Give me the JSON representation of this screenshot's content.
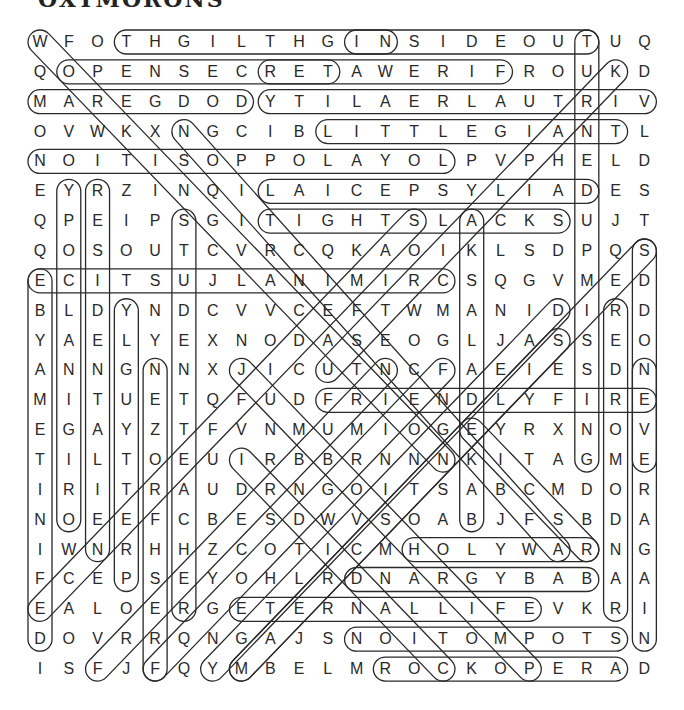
{
  "title": "OXYMORONS",
  "grid": {
    "rows": 22,
    "cols": 22,
    "origin_x": 40,
    "origin_y": 42,
    "step_x": 28.78,
    "step_y": 29.86,
    "letters": [
      "WFOTHGILTHGINSIDEOUTUQ",
      "QOPENSECRETAWERIFROUKD",
      "MAREGDODYTILAERLAUTRIV",
      "OVWKXNGCIBLITTLEGIANTL",
      "NOITISOPPOLAYOLPVPHELD",
      "EYRZINQILAICEPSYLIADES",
      "QPEIPSGITIGHTSLACKSUJT",
      "QOSOUTCVRCQKAOIKLSDPQS",
      "ECITSUJLANIMIRCSQGVMED",
      "BLDYNDCVVCEFTWMANIDIRD",
      "YAELYEXNODASEOGLJASSEO",
      "ANNGNNXJICUTNCFAEIESDN",
      "MITUETQFUDFRIENDLYFIRE",
      "EGAYZTFVNMUMIOGEYRXNOV",
      "TILTOEUIRBBRNNNKITAGME",
      "IRITRAUDRNGOITSABCMDOR",
      "NOEEFCBESDWVSOABJFSBDA",
      "IWNRHHZCOTICMHOLYWARNG",
      "FCEPSEYOHLRDNARGYBABAA",
      "EALOERGETERNALLIFEVKRI",
      "DOVRRQNGAJSNOITOMPOTSN",
      "ISFJFQYMBELMROCKOPERAD"
    ]
  },
  "found_words": [
    {
      "word": "NIGHT LIGHT",
      "start": [
        0,
        12
      ],
      "end": [
        0,
        3
      ]
    },
    {
      "word": "INSIDE OUT",
      "start": [
        0,
        11
      ],
      "end": [
        0,
        19
      ]
    },
    {
      "word": "OPEN SECRET",
      "start": [
        1,
        1
      ],
      "end": [
        1,
        10
      ]
    },
    {
      "word": "FIREWATER",
      "start": [
        1,
        16
      ],
      "end": [
        1,
        8
      ]
    },
    {
      "word": "DODGE RAM",
      "start": [
        2,
        7
      ],
      "end": [
        2,
        0
      ]
    },
    {
      "word": "VIRTUAL REALITY",
      "start": [
        2,
        21
      ],
      "end": [
        2,
        8
      ]
    },
    {
      "word": "LITTLE GIANT",
      "start": [
        3,
        10
      ],
      "end": [
        3,
        20
      ]
    },
    {
      "word": "LOYAL OPPOSITION",
      "start": [
        4,
        14
      ],
      "end": [
        4,
        0
      ]
    },
    {
      "word": "DAILY SPECIAL",
      "start": [
        5,
        19
      ],
      "end": [
        5,
        8
      ]
    },
    {
      "word": "TIGHT SLACKS",
      "start": [
        6,
        8
      ],
      "end": [
        6,
        18
      ]
    },
    {
      "word": "CRIMINAL JUSTICE",
      "start": [
        8,
        14
      ],
      "end": [
        8,
        0
      ]
    },
    {
      "word": "FRIENDLY FIRE",
      "start": [
        12,
        10
      ],
      "end": [
        12,
        21
      ]
    },
    {
      "word": "HOLY WAR",
      "start": [
        17,
        13
      ],
      "end": [
        17,
        19
      ]
    },
    {
      "word": "BABY GRAND",
      "start": [
        18,
        19
      ],
      "end": [
        18,
        11
      ]
    },
    {
      "word": "ETERNAL LIFE",
      "start": [
        19,
        7
      ],
      "end": [
        19,
        17
      ]
    },
    {
      "word": "STOP MOTION",
      "start": [
        20,
        20
      ],
      "end": [
        20,
        11
      ]
    },
    {
      "word": "ROCK OPERA",
      "start": [
        21,
        12
      ],
      "end": [
        21,
        20
      ]
    },
    {
      "word": "TURNED UP MISSING",
      "start": [
        0,
        19
      ],
      "end": [
        14,
        19
      ]
    },
    {
      "word": "EVEN ODDS",
      "start": [
        14,
        21
      ],
      "end": [
        7,
        21
      ]
    },
    {
      "word": "NEVER AGAIN",
      "start": [
        11,
        21
      ],
      "end": [
        20,
        21
      ]
    },
    {
      "word": "RANDOM ORDER",
      "start": [
        19,
        20
      ],
      "end": [
        9,
        20
      ]
    },
    {
      "word": "BAKED ALASKA",
      "start": [
        16,
        15
      ],
      "end": [
        6,
        15
      ]
    },
    {
      "word": "DEFINITE MAYBE",
      "start": [
        20,
        0
      ],
      "end": [
        8,
        0
      ]
    },
    {
      "word": "ORIGINAL COPY",
      "start": [
        16,
        1
      ],
      "end": [
        5,
        1
      ]
    },
    {
      "word": "RESIDENT ALIEN",
      "start": [
        5,
        2
      ],
      "end": [
        17,
        2
      ]
    },
    {
      "word": "PRETTY UGLY",
      "start": [
        18,
        3
      ],
      "end": [
        9,
        3
      ]
    },
    {
      "word": "FRESH FROZEN",
      "start": [
        21,
        4
      ],
      "end": [
        11,
        4
      ]
    },
    {
      "word": "STUDENT TEACHER",
      "start": [
        6,
        5
      ],
      "end": [
        19,
        5
      ]
    },
    {
      "word": "WORKING VACATION",
      "start": [
        0,
        0
      ],
      "end": [
        14,
        14
      ]
    },
    {
      "word": "SCIENCE FICTION",
      "start": [
        17,
        18
      ],
      "end": [
        3,
        5
      ]
    },
    {
      "word": "JUMBO SHRIMP",
      "start": [
        11,
        7
      ],
      "end": [
        21,
        17
      ]
    },
    {
      "word": "SAME DIFFERENCE",
      "start": [
        6,
        13
      ],
      "end": [
        19,
        0
      ]
    },
    {
      "word": "",
      "start": [
        1,
        20
      ],
      "end": [
        11,
        10
      ]
    },
    {
      "word": "",
      "start": [
        7,
        21
      ],
      "end": [
        21,
        7
      ]
    },
    {
      "word": "",
      "start": [
        9,
        18
      ],
      "end": [
        21,
        6
      ]
    },
    {
      "word": "",
      "start": [
        10,
        18
      ],
      "end": [
        21,
        7
      ]
    },
    {
      "word": "",
      "start": [
        11,
        14
      ],
      "end": [
        21,
        4
      ]
    },
    {
      "word": "",
      "start": [
        11,
        12
      ],
      "end": [
        21,
        2
      ]
    },
    {
      "word": "",
      "start": [
        14,
        7
      ],
      "end": [
        21,
        14
      ]
    },
    {
      "word": "",
      "start": [
        13,
        15
      ],
      "end": [
        17,
        19
      ]
    }
  ],
  "style": {
    "ink_color": "#2a2a2a",
    "background": "#ffffff"
  }
}
